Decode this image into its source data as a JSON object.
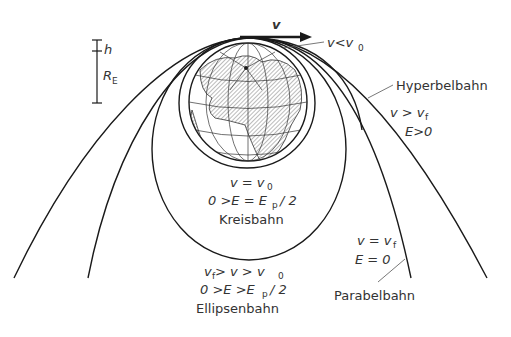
{
  "diagram": {
    "scale_bar": {
      "h_label": "h",
      "r_label": "R",
      "r_sub": "E"
    },
    "velocity": {
      "label": "v"
    },
    "annotations": {
      "inner": {
        "text": "v<v",
        "sub": "0"
      },
      "hyperbola": {
        "name": "Hyperbelbahn",
        "cond1_a": "v > v",
        "cond1_sub": "f",
        "cond2": "E>0"
      },
      "circle": {
        "cond1_a": "v = v",
        "cond1_sub": "0",
        "cond2_a": "0 >E = E",
        "cond2_sub": "p",
        "cond2_b": "/ 2",
        "name": "Kreisbahn"
      },
      "ellipse": {
        "cond1_a": "v",
        "cond1_sub1": "f",
        "cond1_b": " > v > v",
        "cond1_sub2": "0",
        "cond2_a": "0 >E >E",
        "cond2_sub": "p",
        "cond2_b": "/ 2",
        "name": "Ellipsenbahn"
      },
      "parabola": {
        "cond1_a": "v = v",
        "cond1_sub": "f",
        "cond2": "E = 0",
        "name": "Parabelbahn"
      }
    },
    "colors": {
      "line": "#1a1a1a",
      "text": "#333333",
      "hatch": "#555555"
    }
  }
}
